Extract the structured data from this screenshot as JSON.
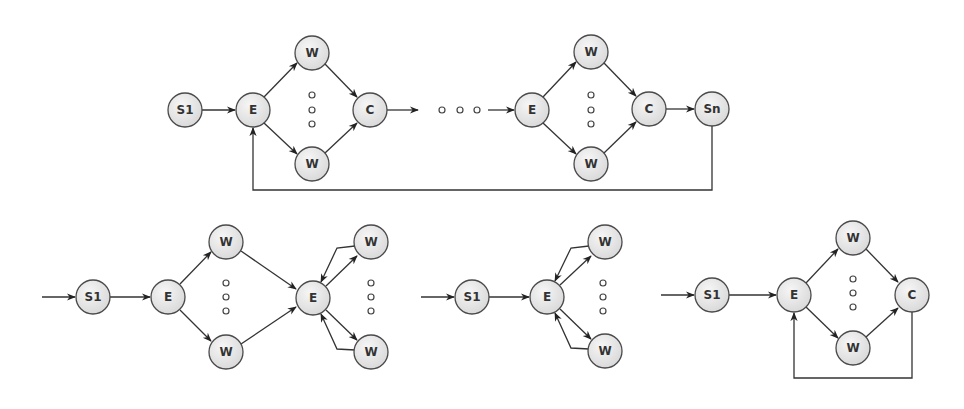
{
  "diagram": {
    "colors": {
      "node_fill": "#e6e6e6",
      "node_stroke": "#4a4a4a",
      "edge": "#333333",
      "background": "#ffffff"
    },
    "node_radius": 17,
    "graphs": [
      {
        "id": "top-pipeline",
        "nodes": [
          {
            "id": "s1",
            "label": "S1",
            "x": 185,
            "y": 110
          },
          {
            "id": "e1",
            "label": "E",
            "x": 253,
            "y": 110
          },
          {
            "id": "w1a",
            "label": "W",
            "x": 312,
            "y": 53
          },
          {
            "id": "w1b",
            "label": "W",
            "x": 312,
            "y": 164
          },
          {
            "id": "c1",
            "label": "C",
            "x": 370,
            "y": 110
          },
          {
            "id": "e2",
            "label": "E",
            "x": 532,
            "y": 110
          },
          {
            "id": "w2a",
            "label": "W",
            "x": 591,
            "y": 52
          },
          {
            "id": "w2b",
            "label": "W",
            "x": 591,
            "y": 164
          },
          {
            "id": "c2",
            "label": "C",
            "x": 649,
            "y": 109
          },
          {
            "id": "sn",
            "label": "Sn",
            "x": 712,
            "y": 109
          }
        ],
        "ellipses": [
          {
            "x": 312,
            "y": 95,
            "orient": "v"
          },
          {
            "x": 591,
            "y": 95,
            "orient": "v"
          },
          {
            "x": 459,
            "y": 110,
            "orient": "h"
          }
        ]
      },
      {
        "id": "bottom-left-farm-feedback",
        "nodes": [
          {
            "id": "s1",
            "label": "S1",
            "x": 93,
            "y": 297
          },
          {
            "id": "e1",
            "label": "E",
            "x": 168,
            "y": 297
          },
          {
            "id": "wa",
            "label": "W",
            "x": 226,
            "y": 242
          },
          {
            "id": "wb",
            "label": "W",
            "x": 226,
            "y": 352
          },
          {
            "id": "e2",
            "label": "E",
            "x": 313,
            "y": 298
          },
          {
            "id": "wc",
            "label": "W",
            "x": 371,
            "y": 242
          },
          {
            "id": "wd",
            "label": "W",
            "x": 371,
            "y": 352
          }
        ],
        "ellipses": [
          {
            "x": 226,
            "y": 297,
            "orient": "v"
          },
          {
            "x": 371,
            "y": 297,
            "orient": "v"
          }
        ]
      },
      {
        "id": "bottom-middle-master-worker",
        "nodes": [
          {
            "id": "s1",
            "label": "S1",
            "x": 472,
            "y": 297
          },
          {
            "id": "e",
            "label": "E",
            "x": 547,
            "y": 297
          },
          {
            "id": "wa",
            "label": "W",
            "x": 605,
            "y": 242
          },
          {
            "id": "wb",
            "label": "W",
            "x": 605,
            "y": 351
          }
        ],
        "ellipses": [
          {
            "x": 603,
            "y": 297,
            "orient": "v"
          }
        ]
      },
      {
        "id": "bottom-right-farm-loop",
        "nodes": [
          {
            "id": "s1",
            "label": "S1",
            "x": 712,
            "y": 295
          },
          {
            "id": "e",
            "label": "E",
            "x": 794,
            "y": 295
          },
          {
            "id": "wa",
            "label": "W",
            "x": 853,
            "y": 238
          },
          {
            "id": "wb",
            "label": "W",
            "x": 853,
            "y": 348
          },
          {
            "id": "c",
            "label": "C",
            "x": 912,
            "y": 295
          }
        ],
        "ellipses": [
          {
            "x": 853,
            "y": 293,
            "orient": "v"
          }
        ]
      }
    ]
  },
  "labels": {
    "top": {
      "s1": "S1",
      "e1": "E",
      "w1a": "W",
      "w1b": "W",
      "c1": "C",
      "e2": "E",
      "w2a": "W",
      "w2b": "W",
      "c2": "C",
      "sn": "Sn"
    },
    "bl": {
      "s1": "S1",
      "e1": "E",
      "wa": "W",
      "wb": "W",
      "e2": "E",
      "wc": "W",
      "wd": "W"
    },
    "bm": {
      "s1": "S1",
      "e": "E",
      "wa": "W",
      "wb": "W"
    },
    "br": {
      "s1": "S1",
      "e": "E",
      "wa": "W",
      "wb": "W",
      "c": "C"
    }
  }
}
